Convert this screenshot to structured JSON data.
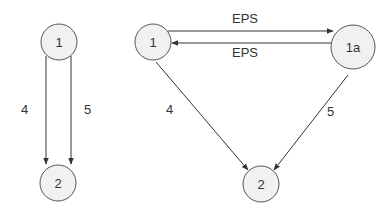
{
  "left_graph": {
    "nodes": [
      {
        "id": "L1",
        "label": "1"
      },
      {
        "id": "L2",
        "label": "2"
      }
    ],
    "edges": [
      {
        "from": "L1",
        "to": "L2",
        "label": "4"
      },
      {
        "from": "L1",
        "to": "L2",
        "label": "5"
      }
    ]
  },
  "right_graph": {
    "nodes": [
      {
        "id": "R1",
        "label": "1"
      },
      {
        "id": "R1a",
        "label": "1a"
      },
      {
        "id": "R2",
        "label": "2"
      }
    ],
    "edges": [
      {
        "from": "R1",
        "to": "R1a",
        "label": "EPS"
      },
      {
        "from": "R1a",
        "to": "R1",
        "label": "EPS"
      },
      {
        "from": "R1",
        "to": "R2",
        "label": "4"
      },
      {
        "from": "R1a",
        "to": "R2",
        "label": "5"
      }
    ]
  },
  "colors": {
    "node_fill": "#f1f1f1",
    "node_stroke": "#555555",
    "edge": "#333333",
    "text": "#333333"
  }
}
